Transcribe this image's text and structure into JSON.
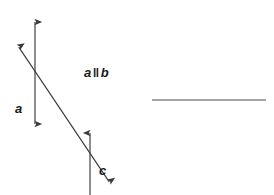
{
  "figure": {
    "kind": "geometry-diagram",
    "background_color": "#ffffff",
    "stroke_color": "#3a3a3a",
    "text_color": "#1a1a1a",
    "labels": {
      "line_a": "a",
      "line_c": "c",
      "parallel_left": "a",
      "parallel_symbol": "‖",
      "parallel_right": "b"
    },
    "geometry": {
      "line_a": {
        "name": "line-a",
        "type": "double-headed-arrow",
        "x1": 35,
        "y1": 17,
        "x2": 35,
        "y2": 129
      },
      "line_b": {
        "name": "line-b",
        "type": "single-headed-arrow-up",
        "x1": 90,
        "y1": 195,
        "x2": 90,
        "y2": 128
      },
      "line_c": {
        "name": "line-c-transversal",
        "type": "double-headed-arrow",
        "x1": 16,
        "y1": 43,
        "x2": 112,
        "y2": 186
      },
      "line_plain": {
        "name": "plain-horizontal-line",
        "type": "segment",
        "x1": 152,
        "y1": 100,
        "x2": 266,
        "y2": 100
      }
    }
  }
}
